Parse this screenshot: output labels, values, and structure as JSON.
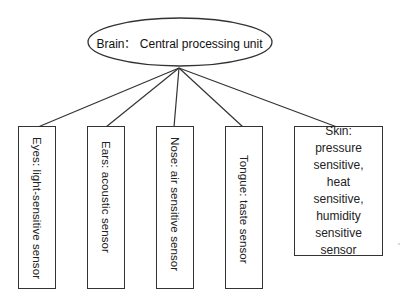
{
  "diagram": {
    "type": "tree",
    "root": {
      "label": "Brain：  Central processing unit"
    },
    "children": [
      {
        "id": "eyes",
        "label": "Eyes: light-sensitive sensor",
        "orientation": "vertical"
      },
      {
        "id": "ears",
        "label": "Ears: acoustic sensor",
        "orientation": "vertical"
      },
      {
        "id": "nose",
        "label": "Nose: air sensitive sensor",
        "orientation": "vertical"
      },
      {
        "id": "tongue",
        "label": "Tongue: taste sensor",
        "orientation": "vertical"
      },
      {
        "id": "skin",
        "label": "Skin: pressure sensitive, heat sensitive, humidity sensitive sensor",
        "orientation": "horizontal"
      }
    ],
    "colors": {
      "line": "#333333",
      "text": "#222222",
      "background": "#ffffff"
    }
  }
}
